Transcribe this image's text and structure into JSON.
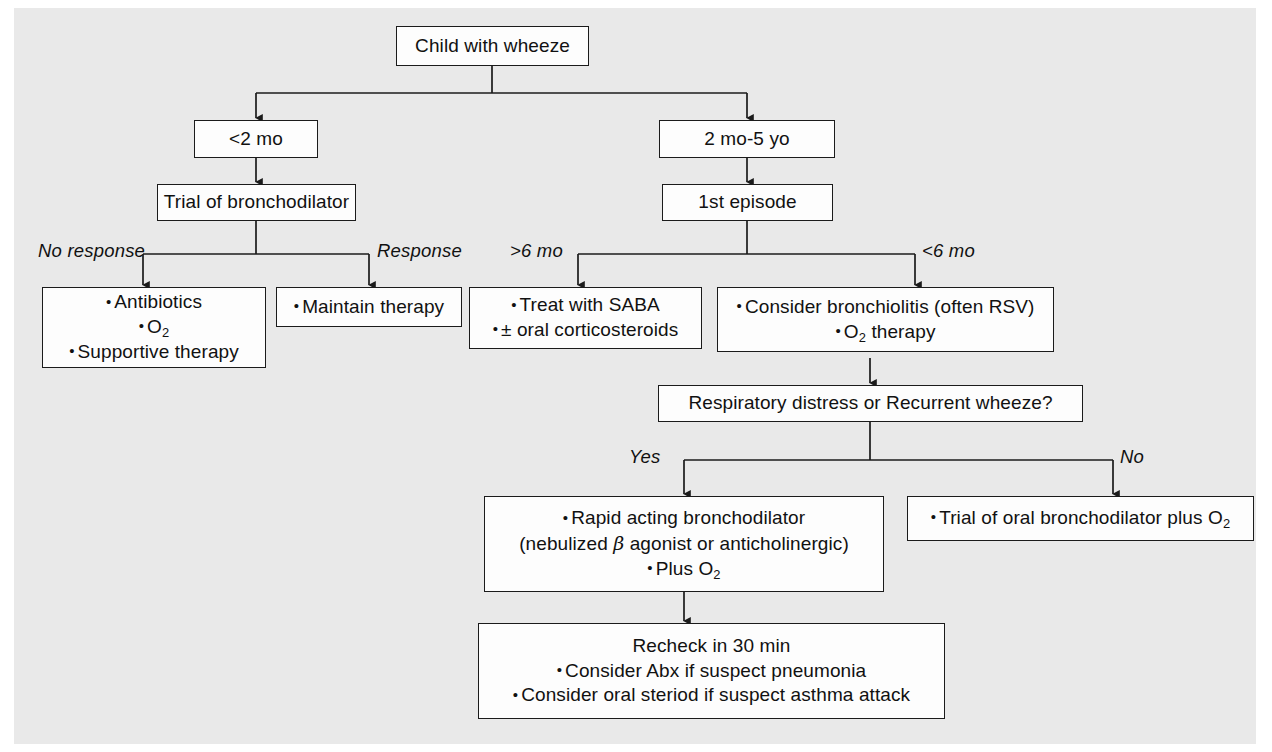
{
  "figure": {
    "background_color": "#e9e9e9",
    "box_fill": "#fdfdfd",
    "line_color": "#1b1b1b"
  },
  "nodes": {
    "root": {
      "text": "Child with wheeze"
    },
    "age_under_2mo": {
      "text": "<2 mo"
    },
    "age_2mo_5yo": {
      "text": "2 mo-5 yo"
    },
    "trial_bronchodilator": {
      "text": "Trial of bronchodilator"
    },
    "first_episode": {
      "text": "1st episode"
    },
    "no_response_box": {
      "lines": [
        "Antibiotics",
        "O2",
        "Supportive therapy"
      ],
      "line1": "Antibiotics",
      "line2_pre": "O",
      "line2_sub": "2",
      "line3": "Supportive therapy"
    },
    "response_box": {
      "line1": "Maintain therapy"
    },
    "over6mo_box": {
      "line1": "Treat with SABA",
      "line2": "± oral corticosteroids"
    },
    "under6mo_box": {
      "line1": "Consider bronchiolitis (often RSV)",
      "line2_pre": "O",
      "line2_sub": "2",
      "line2_post": " therapy"
    },
    "respiratory_distress": {
      "text": "Respiratory distress or Recurrent wheeze?"
    },
    "yes_box": {
      "line1": "Rapid acting bronchodilator",
      "line2_pre": "(nebulized ",
      "line2_beta": "β",
      "line2_post": " agonist or anticholinergic)",
      "line3_pre": "Plus O",
      "line3_sub": "2"
    },
    "no_box": {
      "line1_pre": "Trial of oral bronchodilator plus O",
      "line1_sub": "2"
    },
    "recheck_box": {
      "line1": "Recheck in 30 min",
      "line2": "Consider Abx if suspect pneumonia",
      "line3": "Consider oral steriod if suspect asthma attack"
    }
  },
  "edge_labels": {
    "no_response": "No response",
    "response": "Response",
    "over_6mo": ">6 mo",
    "under_6mo": "<6 mo",
    "yes": "Yes",
    "no": "No"
  }
}
